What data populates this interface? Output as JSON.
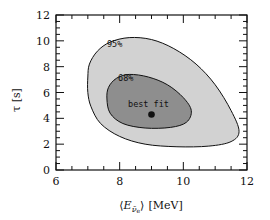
{
  "chart_data": {
    "type": "contour",
    "title": "",
    "xlabel": "⟨Eν̄e⟩ [MeV]",
    "xlabel_parts": {
      "open": "⟨",
      "var": "E",
      "sub": "ν̄",
      "subsub": "e",
      "close": "⟩",
      "unit": "[MeV]"
    },
    "ylabel": "τ [s]",
    "xlim": [
      6,
      12
    ],
    "ylim": [
      0,
      12
    ],
    "xticks": [
      6,
      8,
      10,
      12
    ],
    "yticks": [
      0,
      2,
      4,
      6,
      8,
      10,
      12
    ],
    "xminor_step": 0.5,
    "yminor_step": 0.5,
    "grid": false,
    "best_fit": {
      "label": "best fit",
      "x": 9.0,
      "y": 4.3
    },
    "contours": [
      {
        "name": "95%",
        "label": "95%",
        "label_pos": {
          "x": 7.6,
          "y": 9.5
        },
        "fill": "#d2d2d2",
        "points": [
          [
            7.0,
            7.2
          ],
          [
            7.05,
            8.2
          ],
          [
            7.3,
            9.2
          ],
          [
            7.7,
            9.9
          ],
          [
            8.3,
            10.25
          ],
          [
            9.0,
            10.1
          ],
          [
            9.7,
            9.4
          ],
          [
            10.4,
            8.2
          ],
          [
            11.0,
            6.6
          ],
          [
            11.5,
            4.6
          ],
          [
            11.75,
            3.0
          ],
          [
            11.5,
            2.2
          ],
          [
            10.8,
            1.85
          ],
          [
            9.8,
            1.8
          ],
          [
            8.8,
            2.0
          ],
          [
            8.0,
            2.6
          ],
          [
            7.4,
            3.6
          ],
          [
            7.1,
            4.9
          ],
          [
            7.0,
            6.0
          ]
        ]
      },
      {
        "name": "68%",
        "label": "68%",
        "label_pos": {
          "x": 7.95,
          "y": 6.9
        },
        "fill": "#8e8e8e",
        "points": [
          [
            7.6,
            5.5
          ],
          [
            7.65,
            6.4
          ],
          [
            7.9,
            7.1
          ],
          [
            8.3,
            7.4
          ],
          [
            8.9,
            7.2
          ],
          [
            9.5,
            6.6
          ],
          [
            10.0,
            5.6
          ],
          [
            10.25,
            4.6
          ],
          [
            10.1,
            3.7
          ],
          [
            9.6,
            3.3
          ],
          [
            8.8,
            3.25
          ],
          [
            8.1,
            3.6
          ],
          [
            7.7,
            4.4
          ]
        ]
      }
    ]
  }
}
